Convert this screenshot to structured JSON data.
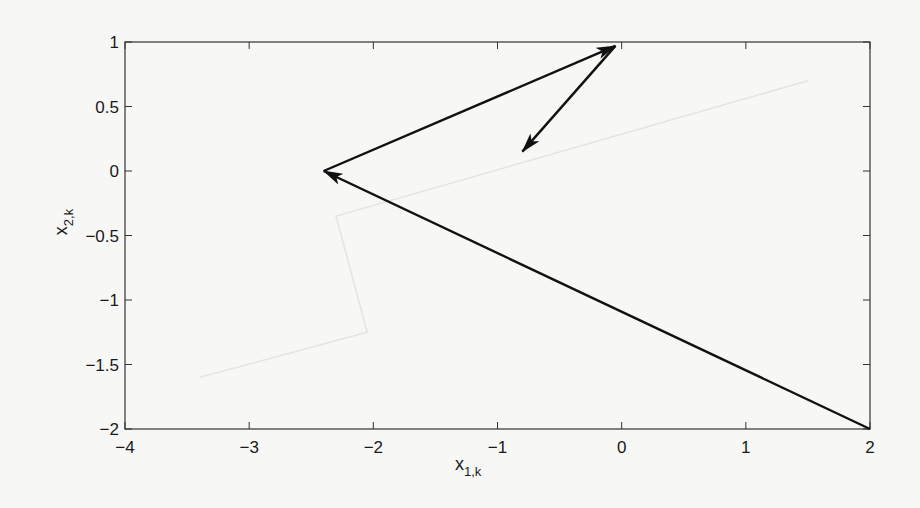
{
  "chart_data": {
    "type": "line",
    "subtype": "arrow-trajectory",
    "title": "",
    "xlabel": "x",
    "xlabel_sub": "1,k",
    "ylabel": "x",
    "ylabel_sub": "2,k",
    "xlim": [
      -4,
      2
    ],
    "ylim": [
      -2,
      1
    ],
    "xticks": [
      -4,
      -3,
      -2,
      -1,
      0,
      1,
      2
    ],
    "xtick_labels": [
      "−4",
      "−3",
      "−2",
      "−1",
      "0",
      "1",
      "2"
    ],
    "yticks": [
      -2,
      -1.5,
      -1,
      -0.5,
      0,
      0.5,
      1
    ],
    "ytick_labels": [
      "−2",
      "−1.5",
      "−1",
      "−0.5",
      "0",
      "0.5",
      "1"
    ],
    "grid": false,
    "legend": null,
    "series": [
      {
        "name": "trajectory",
        "color": "#111111",
        "points": [
          [
            2,
            -2
          ],
          [
            -2.4,
            0.0
          ],
          [
            -0.05,
            0.97
          ],
          [
            -0.8,
            0.15
          ]
        ],
        "arrows": [
          {
            "from": [
              2,
              -2
            ],
            "to": [
              -2.4,
              0.0
            ]
          },
          {
            "from": [
              -2.4,
              0.0
            ],
            "to": [
              -0.05,
              0.97
            ]
          },
          {
            "from": [
              -0.05,
              0.97
            ],
            "to": [
              -0.8,
              0.15
            ]
          }
        ]
      },
      {
        "name": "show-through (faint, reverse page)",
        "color": "#e3e3e0",
        "points": [
          [
            -3.4,
            -1.6
          ],
          [
            -2.05,
            -1.25
          ],
          [
            -2.3,
            -0.35
          ],
          [
            1.5,
            0.7
          ]
        ]
      }
    ]
  },
  "plot": {
    "left_px": 125,
    "right_px": 870,
    "top_px": 42,
    "bottom_px": 429,
    "axis_color": "#333333",
    "background": "#f7f7f5"
  }
}
